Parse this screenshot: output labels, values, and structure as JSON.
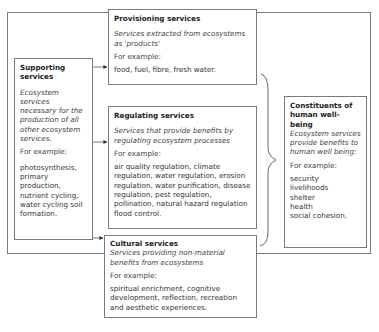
{
  "diagram": {
    "supporting": {
      "title": "Supporting services",
      "description": "Ecosystem services necessary for the production of all other ecosystem services.",
      "example_label": "For example:",
      "examples": "photosynthesis, primary production, nutrient cycling, water cycling soil formation."
    },
    "provisioning": {
      "title": "Provisioning services",
      "description": "Services extracted from ecosystems as 'products'",
      "example_label": "For example:",
      "examples": "food, fuel, fibre, fresh water."
    },
    "regulating": {
      "title": "Regulating services",
      "description": "Services that provide benefits by regulating ecosystem processes",
      "example_label": "For example:",
      "examples": "air quality regulation, climate regulation, water regulation, erosion regulation, water purification, disease regulation, pest regulation, pollination, natural hazard regulation flood control."
    },
    "cultural": {
      "title": "Cultural services",
      "description": "Services providing non-material benefits from ecosystems",
      "example_label": "For example:",
      "examples": "spiritual enrichment, cognitive development, reflection, recreation and aesthetic experiences."
    },
    "constituents": {
      "title": "Constituents of human well-being",
      "description": "Ecosystem services provide benefits to human well being:",
      "example_label": "For example:",
      "examples": [
        "security",
        "livelihoods",
        "shelter",
        "health",
        "social cohesion."
      ]
    },
    "connections": [
      {
        "from": "supporting",
        "to": "provisioning",
        "type": "arrow"
      },
      {
        "from": "supporting",
        "to": "regulating",
        "type": "arrow"
      },
      {
        "from": "supporting",
        "to": "cultural",
        "type": "arrow"
      },
      {
        "from": [
          "provisioning",
          "regulating",
          "cultural"
        ],
        "to": "constituents",
        "type": "brace"
      }
    ]
  }
}
